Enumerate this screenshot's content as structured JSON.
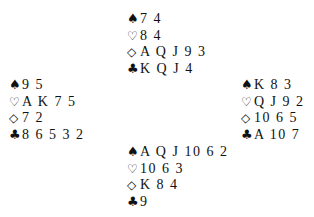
{
  "hands": {
    "north": {
      "spades": "7 4",
      "hearts": "8 4",
      "diamonds": "A Q J 9 3",
      "clubs": "K Q J 4"
    },
    "west": {
      "spades": "9 5",
      "hearts": "A K 7 5",
      "diamonds": "7 2",
      "clubs": "8 6 5 3 2"
    },
    "east": {
      "spades": "K 8 3",
      "hearts": "Q J 9 2",
      "diamonds": "10 6 5",
      "clubs": "A 10 7"
    },
    "south": {
      "spades": "A Q J 10 6 2",
      "hearts": "10 6 3",
      "diamonds": "K 8 4",
      "clubs": "9"
    }
  },
  "icons": {
    "spades": "♠",
    "hearts": "♡",
    "diamonds": "◇",
    "clubs": "♣"
  }
}
